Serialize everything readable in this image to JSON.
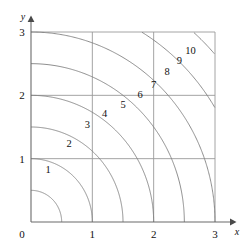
{
  "chart_data": {
    "type": "line",
    "title": "",
    "subtitle": "",
    "xlabel": "x",
    "ylabel": "y",
    "xlim": [
      0,
      3
    ],
    "ylim": [
      0,
      3
    ],
    "grid": true,
    "legend": "none",
    "x_ticks": [
      "0",
      "1",
      "2",
      "3"
    ],
    "x_tick_values": [
      0,
      1,
      2,
      3
    ],
    "y_ticks": [
      "0",
      "1",
      "2",
      "3"
    ],
    "y_tick_values": [
      0,
      1,
      2,
      3
    ],
    "origin_label": "0",
    "contours": [
      {
        "label": "1",
        "level": 1,
        "radius": 0.5,
        "label_x": 0.28,
        "label_y": 0.78
      },
      {
        "label": "2",
        "level": 2,
        "radius": 1.0,
        "label_x": 0.62,
        "label_y": 1.18
      },
      {
        "label": "3",
        "level": 3,
        "radius": 1.5,
        "label_x": 0.92,
        "label_y": 1.48
      },
      {
        "label": "4",
        "level": 4,
        "radius": 2.0,
        "label_x": 1.2,
        "label_y": 1.66
      },
      {
        "label": "5",
        "level": 5,
        "radius": 2.5,
        "label_x": 1.5,
        "label_y": 1.8
      },
      {
        "label": "6",
        "level": 6,
        "radius": 3.0,
        "label_x": 1.78,
        "label_y": 1.96
      },
      {
        "label": "7",
        "level": 7,
        "radius": 3.5,
        "label_x": 2.0,
        "label_y": 2.12
      },
      {
        "label": "8",
        "level": 8,
        "radius": 4.0,
        "label_x": 2.22,
        "label_y": 2.32
      },
      {
        "label": "9",
        "level": 9,
        "radius": 4.5,
        "label_x": 2.42,
        "label_y": 2.5
      },
      {
        "label": "10",
        "level": 10,
        "radius": 5.0,
        "label_x": 2.6,
        "label_y": 2.66
      }
    ],
    "arc_crossings_x_axis": [
      0.5,
      1.0,
      1.5,
      2.0,
      2.5,
      3.0
    ],
    "arc_crossings_y_axis": [
      0.5,
      1.0,
      1.5,
      2.0,
      2.5,
      3.0
    ]
  },
  "colors": {
    "contour": "#7a7a7a",
    "grid": "#9a9a9a",
    "axis": "#6b6b6b",
    "text": "#111111",
    "background": "#ffffff"
  }
}
